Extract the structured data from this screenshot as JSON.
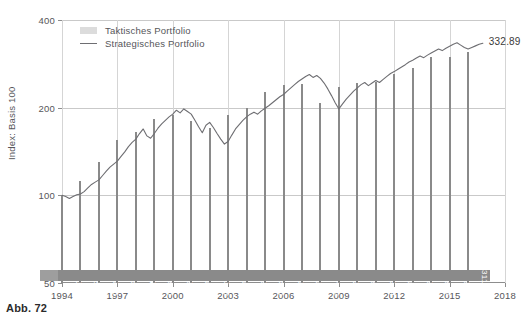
{
  "caption": "Abb. 72",
  "legend": {
    "items": [
      {
        "label": "Taktisches Portfolio",
        "marker": "swatch",
        "color": "#dcdcdc"
      },
      {
        "label": "Strategisches Portfolio",
        "marker": "line",
        "color": "#6e6e72"
      }
    ]
  },
  "end_annotation": "332.89",
  "chart_data": {
    "type": "bar",
    "title": "",
    "subtitle": "",
    "xlabel": "",
    "ylabel": "Index: Basis 100",
    "yscale": "log",
    "ylim": [
      50,
      400
    ],
    "yticks": [
      50,
      100,
      200,
      400
    ],
    "yticklabels": [
      "50",
      "100",
      "200",
      "400"
    ],
    "xlim": [
      1994,
      2018
    ],
    "xticks": [
      1994,
      1997,
      2000,
      2003,
      2006,
      2009,
      2012,
      2015,
      2018
    ],
    "xticklabels": [
      "1994",
      "1997",
      "2000",
      "2003",
      "2006",
      "2009",
      "2012",
      "2015",
      "2018"
    ],
    "grid": "both",
    "legend_position": "top-left",
    "categories": [
      1994,
      1995,
      1996,
      1997,
      1998,
      1999,
      2000,
      2001,
      2002,
      2003,
      2004,
      2005,
      2006,
      2007,
      2008,
      2009,
      2010,
      2011,
      2012,
      2013,
      2014,
      2015,
      2016
    ],
    "series": [
      {
        "name": "Taktisches Portfolio",
        "type": "bar",
        "color": "#8a8a8a",
        "values": [
          100.0,
          112.32,
          129.66,
          155.33,
          164.78,
          183.25,
          188.76,
          179.95,
          170.53,
          189.13,
          198.71,
          226.65,
          239.19,
          241.77,
          207.62,
          236.37,
          243.55,
          245.04,
          261.7,
          273.03,
          298.47,
          298.79,
          311.54
        ],
        "labels": [
          "100.00",
          "112.32",
          "129.66",
          "155.33",
          "164.78",
          "183.25",
          "188.76",
          "179.95",
          "170.53",
          "189.13",
          "198.71",
          "226.65",
          "239.19",
          "241.77",
          "207.62",
          "236.37",
          "243.55",
          "245.04",
          "261.70",
          "273.03",
          "298.47",
          "298.79",
          "311.54"
        ]
      },
      {
        "name": "Strategisches Portfolio",
        "type": "line",
        "color": "#6e6e72",
        "x": [
          1994.0,
          1994.2,
          1994.4,
          1994.6,
          1994.8,
          1995.0,
          1995.2,
          1995.4,
          1995.6,
          1995.8,
          1996.0,
          1996.2,
          1996.4,
          1996.6,
          1996.8,
          1997.0,
          1997.2,
          1997.4,
          1997.6,
          1997.8,
          1998.0,
          1998.2,
          1998.4,
          1998.6,
          1998.8,
          1999.0,
          1999.2,
          1999.4,
          1999.6,
          1999.8,
          2000.0,
          2000.2,
          2000.4,
          2000.6,
          2000.8,
          2001.0,
          2001.2,
          2001.4,
          2001.6,
          2001.8,
          2002.0,
          2002.2,
          2002.4,
          2002.6,
          2002.8,
          2003.0,
          2003.2,
          2003.4,
          2003.6,
          2003.8,
          2004.0,
          2004.2,
          2004.4,
          2004.6,
          2004.8,
          2005.0,
          2005.2,
          2005.4,
          2005.6,
          2005.8,
          2006.0,
          2006.2,
          2006.4,
          2006.6,
          2006.8,
          2007.0,
          2007.2,
          2007.4,
          2007.6,
          2007.8,
          2008.0,
          2008.2,
          2008.4,
          2008.6,
          2008.8,
          2009.0,
          2009.2,
          2009.4,
          2009.6,
          2009.8,
          2010.0,
          2010.2,
          2010.4,
          2010.6,
          2010.8,
          2011.0,
          2011.2,
          2011.4,
          2011.6,
          2011.8,
          2012.0,
          2012.2,
          2012.4,
          2012.6,
          2012.8,
          2013.0,
          2013.2,
          2013.4,
          2013.6,
          2013.8,
          2014.0,
          2014.2,
          2014.4,
          2014.6,
          2014.8,
          2015.0,
          2015.2,
          2015.4,
          2015.6,
          2015.8,
          2016.0,
          2016.2,
          2016.4,
          2016.6,
          2016.8
        ],
        "values": [
          100.0,
          99.0,
          97.5,
          99.0,
          100.5,
          101.0,
          103.0,
          106.0,
          109.0,
          111.0,
          113.0,
          117.0,
          121.0,
          125.0,
          128.0,
          131.0,
          136.0,
          141.0,
          147.0,
          152.0,
          156.0,
          163.0,
          169.0,
          160.0,
          157.0,
          163.0,
          170.0,
          176.0,
          181.0,
          186.0,
          190.0,
          196.0,
          192.0,
          198.0,
          194.0,
          190.0,
          181.0,
          172.0,
          164.0,
          174.0,
          178.0,
          171.0,
          163.0,
          156.0,
          150.0,
          153.0,
          161.0,
          169.0,
          175.0,
          181.0,
          186.0,
          190.0,
          193.0,
          190.0,
          195.0,
          199.0,
          203.0,
          208.0,
          213.0,
          218.0,
          222.0,
          228.0,
          234.0,
          240.0,
          246.0,
          251.0,
          256.0,
          260.0,
          254.0,
          258.0,
          252.0,
          243.0,
          232.0,
          220.0,
          208.0,
          198.0,
          206.0,
          214.0,
          221.0,
          228.0,
          234.0,
          240.0,
          244.0,
          238.0,
          243.0,
          248.0,
          244.0,
          250.0,
          256.0,
          262.0,
          266.0,
          271.0,
          276.0,
          281.0,
          287.0,
          291.0,
          296.0,
          301.0,
          297.0,
          303.0,
          308.0,
          313.0,
          318.0,
          314.0,
          320.0,
          325.0,
          330.0,
          334.0,
          328.0,
          322.0,
          318.0,
          322.0,
          326.0,
          330.0,
          332.89
        ],
        "end_label": "332.89"
      }
    ]
  }
}
